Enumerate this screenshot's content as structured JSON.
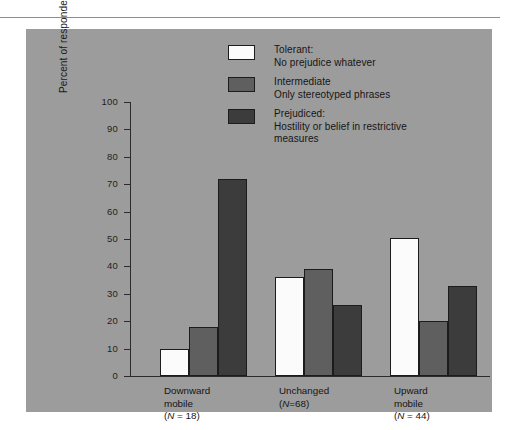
{
  "figure": {
    "background_color": "#9c9c9c",
    "page_color": "#ffffff",
    "rule_color": "#8e8e8e"
  },
  "chart_data": {
    "type": "bar",
    "title": "",
    "xlabel": "",
    "ylabel": "Percent of respondents within each category of mobility",
    "ylim": [
      0,
      100
    ],
    "ytick_step": 10,
    "yticks": [
      "100",
      "90",
      "80",
      "70",
      "60",
      "50",
      "40",
      "30",
      "20",
      "10",
      "0"
    ],
    "grid": false,
    "legend_position": "top-center",
    "categories": [
      "Downward mobile (N = 18)",
      "Unchanged (N=68)",
      "Upward mobile (N = 44)"
    ],
    "category_lines": [
      [
        "Downward",
        "mobile",
        "(N = 18)"
      ],
      [
        "Unchanged",
        "(N=68)",
        ""
      ],
      [
        "Upward",
        "mobile",
        "(N = 44)"
      ]
    ],
    "series": [
      {
        "name": "Tolerant: No prejudice whatever",
        "legend_line_1": "Tolerant:",
        "legend_line_2": "No prejudice whatever",
        "color": "#fbfbfb",
        "values": [
          10,
          36,
          50.5
        ]
      },
      {
        "name": "Intermediate Only stereotyped phrases",
        "legend_line_1": "Intermediate",
        "legend_line_2": "Only stereotyped phrases",
        "color": "#5f5f5f",
        "values": [
          18,
          39,
          20
        ]
      },
      {
        "name": "Prejudiced: Hostility or belief in restrictive measures",
        "legend_line_1": "Prejudiced:",
        "legend_line_2": "Hostility or belief in restrictive",
        "legend_line_3": "measures",
        "color": "#3c3c3c",
        "values": [
          72,
          26,
          33
        ]
      }
    ]
  }
}
